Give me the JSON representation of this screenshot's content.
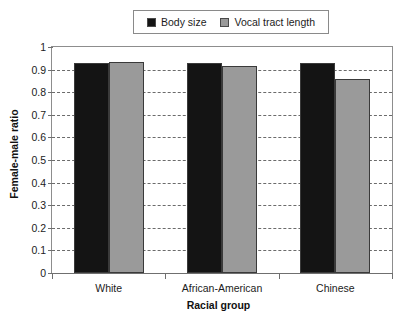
{
  "chart_data": {
    "type": "bar",
    "title": "",
    "xlabel": "Racial group",
    "ylabel": "Female-male ratio",
    "categories": [
      "White",
      "African-American",
      "Chinese"
    ],
    "series": [
      {
        "name": "Body size",
        "color": "#141414",
        "values": [
          0.93,
          0.93,
          0.93
        ]
      },
      {
        "name": "Vocal tract length",
        "color": "#9a9a9a",
        "values": [
          0.935,
          0.915,
          0.86
        ]
      }
    ],
    "ylim": [
      0,
      1
    ],
    "ytick_values": [
      0,
      0.1,
      0.2,
      0.3,
      0.4,
      0.5,
      0.6,
      0.7,
      0.8,
      0.9,
      1
    ],
    "ytick_labels": [
      "0",
      "0.1",
      "0.2",
      "0.3",
      "0.4",
      "0.5",
      "0.6",
      "0.7",
      "0.8",
      "0.9",
      "1"
    ],
    "grid": true,
    "grid_style": "dashed",
    "legend_position": "top-center"
  },
  "colors": {
    "body_size": "#141414",
    "vocal_tract_length": "#9a9a9a",
    "axis": "#6f6f6f",
    "grid": "#6b6b6b",
    "background": "#ffffff"
  }
}
